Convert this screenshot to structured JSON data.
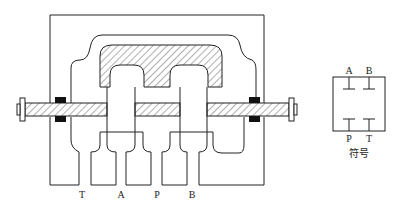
{
  "diagram": {
    "type": "spool-valve-cross-section",
    "ports": [
      {
        "id": "T",
        "label": "T"
      },
      {
        "id": "A",
        "label": "A"
      },
      {
        "id": "P",
        "label": "P"
      },
      {
        "id": "B",
        "label": "B"
      }
    ],
    "symbol": {
      "caption": "符号",
      "top_labels": [
        "A",
        "B"
      ],
      "bottom_labels": [
        "P",
        "T"
      ]
    },
    "colors": {
      "line": "#222222",
      "seal": "#111111",
      "background": "#ffffff"
    }
  }
}
